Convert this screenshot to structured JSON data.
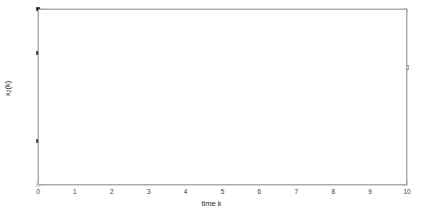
{
  "figure": {
    "background_color": "#ffffff",
    "axes_color": "#aaaaaa",
    "text_color": "#2b2b2b"
  },
  "labels": {
    "xlabel": "time k",
    "ylabel_base": "x",
    "ylabel_sub": "2",
    "ylabel_tail": "(k)",
    "ylabel_full": "x2(k)"
  },
  "chart_data": {
    "type": "line",
    "title": "",
    "xlabel": "time k",
    "ylabel": "x_2(k)",
    "x": [
      0,
      1,
      2,
      3,
      4,
      5,
      6,
      7,
      8,
      9,
      10
    ],
    "xlim": [
      0,
      10
    ],
    "ylim": [
      -20,
      20
    ],
    "xticks": [
      0,
      1,
      2,
      3,
      4,
      5,
      6,
      7,
      8,
      9,
      10
    ],
    "yticks": [
      -20,
      -15,
      -10,
      -5,
      0,
      5,
      10,
      15,
      20
    ],
    "xticklabels": [
      "0",
      "1",
      "2",
      "3",
      "4",
      "5",
      "6",
      "7",
      "8",
      "9",
      "10"
    ],
    "yticklabels": [
      "-20",
      "-15",
      "-10",
      "-5",
      "0",
      "5",
      "10",
      "15",
      "20"
    ],
    "grid": false,
    "legend": "none",
    "marker": "square",
    "series": [
      {
        "name": "trajectory-x0-20",
        "color": "#1f1f1f",
        "values": [
          20,
          1.8,
          1.5,
          2.4,
          0.5,
          0.15,
          -0.7,
          0.05,
          0.2,
          2.1,
          6.7
        ]
      },
      {
        "name": "trajectory-x0-10",
        "color": "#2a2a2a",
        "values": [
          10,
          1.0,
          1.0,
          1.9,
          0.5,
          0.15,
          -0.7,
          0.05,
          0.2,
          2.1,
          6.7
        ]
      },
      {
        "name": "trajectory-x0-neg10",
        "color": "#333333",
        "values": [
          -10,
          -0.9,
          0.1,
          1.2,
          0.45,
          0.15,
          -0.7,
          0.05,
          0.2,
          2.1,
          6.7
        ]
      },
      {
        "name": "trajectory-x0-neg20",
        "color": "#bfe3b0",
        "values": [
          -20,
          -1.6,
          -0.5,
          0.6,
          0.4,
          0.1,
          -0.7,
          0.05,
          0.2,
          2.1,
          6.7
        ]
      }
    ]
  }
}
